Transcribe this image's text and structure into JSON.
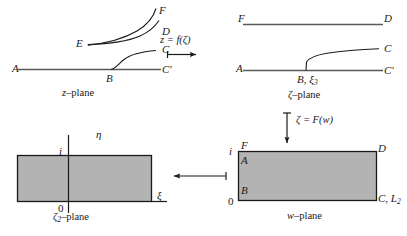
{
  "figure": {
    "background_color": "#ffffff",
    "line_color": "#1a1a1a",
    "shade_color": "#b3b3b3"
  },
  "panels": {
    "z_plane": {
      "name": "z–plane",
      "name_prefix": "z",
      "name_suffix": "–plane",
      "points": {
        "A": "A",
        "B": "B",
        "C": "C",
        "C_prime": "C′",
        "D": "D",
        "E": "E",
        "F": "F"
      }
    },
    "zeta_plane": {
      "name": "ζ–plane",
      "name_prefix": "ζ",
      "name_suffix": "–plane",
      "points": {
        "A": "A",
        "B": "B, ξ",
        "B_sub": "3",
        "C": "C",
        "C_prime": "C′",
        "D": "D",
        "F": "F"
      }
    },
    "zeta2_plane": {
      "name": "ζ₂–plane",
      "name_prefix": "ζ",
      "name_sub": "2",
      "name_suffix": "–plane",
      "axes": {
        "vertical_label": "η",
        "horizontal_label": "ξ",
        "origin_label": "0",
        "unit_label": "i"
      }
    },
    "w_plane": {
      "name": "w–plane",
      "name_prefix": "w",
      "name_suffix": "–plane",
      "points": {
        "F": "F",
        "A": "A",
        "B": "B",
        "D": "D",
        "C": "C, L",
        "C_sub": "2"
      },
      "axes": {
        "origin_label": "0",
        "unit_label": "i"
      }
    }
  },
  "maps": {
    "top_arrow": {
      "label_full": "z = f(ζ)",
      "lhs": "z",
      "eq": "=",
      "fn": "f(ζ)",
      "direction": "right"
    },
    "vertical_arrow": {
      "label_full": "ζ = F(w)",
      "lhs": "ζ",
      "eq": "=",
      "fn": "F(w)",
      "direction": "down"
    },
    "bottom_arrow": {
      "label_full": "",
      "direction": "left"
    }
  }
}
